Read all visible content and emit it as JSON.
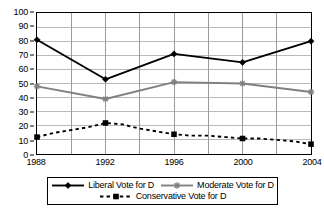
{
  "chart_data": {
    "type": "line",
    "title": "",
    "xlabel": "",
    "ylabel": "",
    "x": [
      1988,
      1992,
      1996,
      2000,
      2004
    ],
    "categories": [
      "1988",
      "1992",
      "1996",
      "2000",
      "2004"
    ],
    "xlim": [
      1988,
      2004
    ],
    "ylim": [
      0,
      100
    ],
    "ytick_labels": [
      "100",
      "90",
      "80",
      "70",
      "60",
      "50",
      "40",
      "30",
      "20",
      "10",
      "0"
    ],
    "ytick_values": [
      100,
      90,
      80,
      70,
      60,
      50,
      40,
      30,
      20,
      10,
      0
    ],
    "xtick_labels": [
      "1988",
      "1992",
      "1996",
      "2000",
      "2004"
    ],
    "grid": "horizontal and vertical gridlines every 10 units and every 2 years",
    "legend_position": "below-plot",
    "series": [
      {
        "name": "Liberal Vote for D",
        "color": "#000000",
        "style": "solid",
        "marker": "diamond",
        "values": [
          81,
          53,
          71,
          65,
          80
        ]
      },
      {
        "name": "Moderate Vote for D",
        "color": "#808080",
        "style": "solid",
        "marker": "asterisk",
        "values": [
          48,
          39,
          51,
          50,
          44
        ]
      },
      {
        "name": "Conservative Vote for D",
        "color": "#000000",
        "style": "dashed",
        "marker": "square",
        "values": [
          12,
          22,
          14,
          11,
          7
        ],
        "interpolated_points": [
          {
            "x": 1988,
            "y": 12
          },
          {
            "x": 1989,
            "y": 15
          },
          {
            "x": 1990,
            "y": 17
          },
          {
            "x": 1991,
            "y": 19
          },
          {
            "x": 1992,
            "y": 22
          },
          {
            "x": 1993,
            "y": 21
          },
          {
            "x": 1994,
            "y": 18
          },
          {
            "x": 1995,
            "y": 16
          },
          {
            "x": 1996,
            "y": 14
          },
          {
            "x": 1997,
            "y": 13
          },
          {
            "x": 1998,
            "y": 13
          },
          {
            "x": 1999,
            "y": 12
          },
          {
            "x": 2000,
            "y": 11
          },
          {
            "x": 2001,
            "y": 11
          },
          {
            "x": 2002,
            "y": 10
          },
          {
            "x": 2003,
            "y": 9
          },
          {
            "x": 2004,
            "y": 7
          }
        ]
      }
    ]
  },
  "legend": {
    "rows": [
      [
        "Liberal Vote for D",
        "Moderate Vote for D"
      ],
      [
        "Conservative Vote for D"
      ]
    ]
  }
}
